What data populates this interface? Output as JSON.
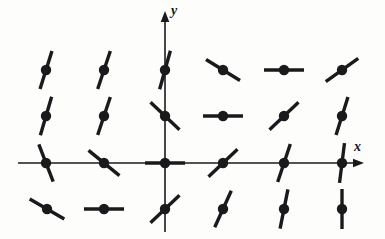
{
  "figure": {
    "kind": "direction-field",
    "width": 385,
    "height": 239,
    "background_color": "#fdfdfc",
    "ink_color": "#1a1a1d"
  },
  "axes": {
    "x_axis": {
      "label": "x",
      "label_position": [
        354,
        140
      ],
      "line_y": 163,
      "line_x_start": 18,
      "line_x_end": 356,
      "arrow_tip_x": 364,
      "arrow": true
    },
    "y_axis": {
      "label": "y",
      "label_position": [
        171,
        4
      ],
      "line_x": 165,
      "line_y_start": 232,
      "line_y_end": 20,
      "arrow_tip_y": 11,
      "arrow": true
    },
    "origin": [
      165,
      163
    ],
    "axis_stroke_width": 1.6
  },
  "chart_data": {
    "type": "scatter",
    "title": "",
    "xlabel": "x",
    "ylabel": "y",
    "grid": false,
    "legend": null,
    "grid_columns_px": [
      46,
      104,
      165,
      223,
      284,
      342
    ],
    "grid_rows_px": [
      70,
      116,
      163,
      209
    ],
    "dot_radius_px": 5.2,
    "segment_half_length_px": 20,
    "segment_stroke_width_px": 3.4,
    "elements": [
      {
        "row": 1,
        "col": 1,
        "cx": 46,
        "cy": 70,
        "slope_screen": -3.2,
        "slope": 3.2,
        "note": "steep, leaning right-up"
      },
      {
        "row": 1,
        "col": 2,
        "cx": 104,
        "cy": 70,
        "slope_screen": -3.0,
        "slope": 3.0,
        "note": "steep"
      },
      {
        "row": 1,
        "col": 3,
        "cx": 165,
        "cy": 70,
        "slope_screen": -3.6,
        "slope": 3.6,
        "note": "steep, on y-axis"
      },
      {
        "row": 1,
        "col": 4,
        "cx": 223,
        "cy": 70,
        "slope_screen": 0.62,
        "slope": -0.62,
        "note": "negative"
      },
      {
        "row": 1,
        "col": 5,
        "cx": 284,
        "cy": 70,
        "slope_screen": 0.0,
        "slope": 0.0,
        "note": "horizontal"
      },
      {
        "row": 1,
        "col": 6,
        "cx": 342,
        "cy": 70,
        "slope_screen": -0.72,
        "slope": 0.72,
        "note": "positive"
      },
      {
        "row": 2,
        "col": 1,
        "cx": 46,
        "cy": 116,
        "slope_screen": -3.4,
        "slope": 3.4,
        "note": "steep"
      },
      {
        "row": 2,
        "col": 2,
        "cx": 104,
        "cy": 116,
        "slope_screen": -3.0,
        "slope": 3.0,
        "note": "steep"
      },
      {
        "row": 2,
        "col": 3,
        "cx": 165,
        "cy": 116,
        "slope_screen": 0.95,
        "slope": -0.95,
        "note": "negative, on y-axis"
      },
      {
        "row": 2,
        "col": 4,
        "cx": 223,
        "cy": 116,
        "slope_screen": 0.0,
        "slope": 0.0,
        "note": "horizontal"
      },
      {
        "row": 2,
        "col": 5,
        "cx": 284,
        "cy": 116,
        "slope_screen": -0.95,
        "slope": 0.95,
        "note": "positive"
      },
      {
        "row": 2,
        "col": 6,
        "cx": 342,
        "cy": 116,
        "slope_screen": -3.2,
        "slope": 3.2,
        "note": "steep positive"
      },
      {
        "row": 3,
        "col": 1,
        "cx": 46,
        "cy": 163,
        "slope_screen": 2.6,
        "slope": -2.6,
        "note": "steep negative, on x-axis"
      },
      {
        "row": 3,
        "col": 2,
        "cx": 104,
        "cy": 163,
        "slope_screen": 0.82,
        "slope": -0.82,
        "note": "negative, on x-axis"
      },
      {
        "row": 3,
        "col": 3,
        "cx": 165,
        "cy": 163,
        "slope_screen": 0.0,
        "slope": 0.0,
        "note": "horizontal, at origin"
      },
      {
        "row": 3,
        "col": 4,
        "cx": 223,
        "cy": 163,
        "slope_screen": -0.95,
        "slope": 0.95,
        "note": "positive, on x-axis"
      },
      {
        "row": 3,
        "col": 5,
        "cx": 284,
        "cy": 163,
        "slope_screen": -3.0,
        "slope": 3.0,
        "note": "steep positive, on x-axis"
      },
      {
        "row": 3,
        "col": 6,
        "cx": 342,
        "cy": 163,
        "slope_screen": -8.0,
        "slope": 8.0,
        "note": "near vertical, on x-axis"
      },
      {
        "row": 4,
        "col": 1,
        "cx": 47,
        "cy": 209,
        "slope_screen": 0.58,
        "slope": -0.58,
        "note": "negative"
      },
      {
        "row": 4,
        "col": 2,
        "cx": 104,
        "cy": 209,
        "slope_screen": 0.0,
        "slope": 0.0,
        "note": "horizontal"
      },
      {
        "row": 4,
        "col": 3,
        "cx": 165,
        "cy": 209,
        "slope_screen": -0.95,
        "slope": 0.95,
        "note": "positive, on y-axis"
      },
      {
        "row": 4,
        "col": 4,
        "cx": 223,
        "cy": 209,
        "slope_screen": -2.2,
        "slope": 2.2,
        "note": "steep positive"
      },
      {
        "row": 4,
        "col": 5,
        "cx": 284,
        "cy": 209,
        "slope_screen": -5.0,
        "slope": 5.0,
        "note": "very steep positive"
      },
      {
        "row": 4,
        "col": 6,
        "cx": 342,
        "cy": 209,
        "slope_screen": -40.0,
        "slope": 40.0,
        "note": "vertical"
      }
    ]
  }
}
